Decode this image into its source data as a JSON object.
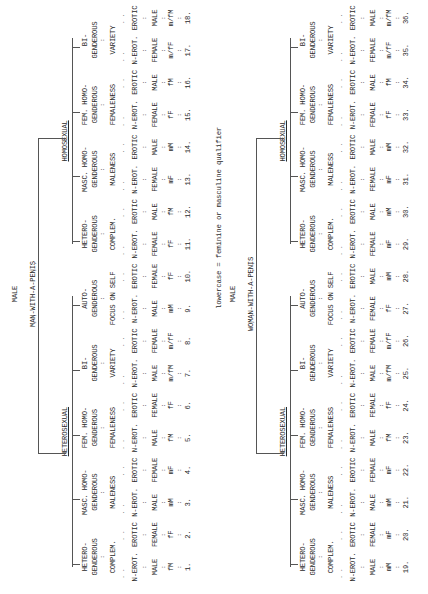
{
  "footnote": "lowercase = feminine or masculine qualifier",
  "trees": [
    {
      "root": "MALE",
      "subject": "MAN-WITH-A-PENIS",
      "branches": [
        {
          "label": "HETEROSEXUAL",
          "groups": [
            {
              "l1": "HETERO-",
              "l2": "GENDEROUS",
              "desc": "COMPLEM.",
              "leaves": [
                {
                  "mode": "N-EROT.",
                  "sex": "MALE",
                  "code": "fM",
                  "n": "1."
                },
                {
                  "mode": "EROTIC",
                  "sex": "FEMALE",
                  "code": "fF",
                  "n": "2."
                }
              ]
            },
            {
              "l1": "MASC. HOMO-",
              "l2": "GENDEROUS",
              "desc": "MALENESS",
              "leaves": [
                {
                  "mode": "N-EROT.",
                  "sex": "MALE",
                  "code": "mM",
                  "n": "3."
                },
                {
                  "mode": "EROTIC",
                  "sex": "FEMALE",
                  "code": "mF",
                  "n": "4."
                }
              ]
            },
            {
              "l1": "FEM. HOMO-",
              "l2": "GENDEROUS",
              "desc": "FEMALENESS",
              "leaves": [
                {
                  "mode": "N-EROT.",
                  "sex": "MALE",
                  "code": "fM",
                  "n": "5."
                },
                {
                  "mode": "EROTIC",
                  "sex": "FEMALE",
                  "code": "fF",
                  "n": "6."
                }
              ]
            },
            {
              "l1": "BI-",
              "l2": "GENDEROUS",
              "desc": "VARIETY",
              "leaves": [
                {
                  "mode": "N-EROT.",
                  "sex": "MALE",
                  "code": "m/fM",
                  "n": "7."
                },
                {
                  "mode": "EROTIC",
                  "sex": "FEMALE",
                  "code": "m/fF",
                  "n": "8."
                }
              ]
            },
            {
              "l1": "AUTO-",
              "l2": "GENDEROUS",
              "desc": "FOCUS ON SELF",
              "leaves": [
                {
                  "mode": "N-EROT.",
                  "sex": "MALE",
                  "code": "mM",
                  "n": "9."
                },
                {
                  "mode": "EROTIC",
                  "sex": "FEMALE",
                  "code": "fF",
                  "n": "10."
                }
              ]
            }
          ]
        },
        {
          "label": "HOMOSEXUAL",
          "groups": [
            {
              "l1": "HETERO-",
              "l2": "GENDEROUS",
              "desc": "COMPLEM.",
              "leaves": [
                {
                  "mode": "N-EROT.",
                  "sex": "FEMALE",
                  "code": "fF",
                  "n": "11."
                },
                {
                  "mode": "EROTIC",
                  "sex": "MALE",
                  "code": "fM",
                  "n": "12."
                }
              ]
            },
            {
              "l1": "MASC. HOMO-",
              "l2": "GENDEROUS",
              "desc": "MALENESS",
              "leaves": [
                {
                  "mode": "N-EROT.",
                  "sex": "FEMALE",
                  "code": "mF",
                  "n": "13."
                },
                {
                  "mode": "EROTIC",
                  "sex": "MALE",
                  "code": "mM",
                  "n": "14."
                }
              ]
            },
            {
              "l1": "FEM. HOMO-",
              "l2": "GENDEROUS",
              "desc": "FEMALENESS",
              "leaves": [
                {
                  "mode": "N-EROT.",
                  "sex": "FEMALE",
                  "code": "fF",
                  "n": "15."
                },
                {
                  "mode": "EROTIC",
                  "sex": "MALE",
                  "code": "fM",
                  "n": "16."
                }
              ]
            },
            {
              "l1": "BI-",
              "l2": "GENDEROUS",
              "desc": "VARIETY",
              "leaves": [
                {
                  "mode": "N-EROT.",
                  "sex": "FEMALE",
                  "code": "m/fF",
                  "n": "17."
                },
                {
                  "mode": "EROTIC",
                  "sex": "MALE",
                  "code": "m/fM",
                  "n": "18."
                }
              ]
            }
          ]
        }
      ]
    },
    {
      "root": "MALE",
      "subject": "WOMAN-WITH-A-PENIS",
      "branches": [
        {
          "label": "HETEROSEXUAL",
          "groups": [
            {
              "l1": "HETERO-",
              "l2": "GENDEROUS",
              "desc": "COMPLEM.",
              "leaves": [
                {
                  "mode": "N-EROT.",
                  "sex": "MALE",
                  "code": "mM",
                  "n": "19."
                },
                {
                  "mode": "EROTIC",
                  "sex": "FEMALE",
                  "code": "mF",
                  "n": "20."
                }
              ]
            },
            {
              "l1": "MASC. HOMO-",
              "l2": "GENDEROUS",
              "desc": "MALENESS",
              "leaves": [
                {
                  "mode": "N-EROT.",
                  "sex": "MALE",
                  "code": "mM",
                  "n": "21."
                },
                {
                  "mode": "EROTIC",
                  "sex": "FEMALE",
                  "code": "mF",
                  "n": "22."
                }
              ]
            },
            {
              "l1": "FEM. HOMO-",
              "l2": "GENDEROUS",
              "desc": "FEMALENESS",
              "leaves": [
                {
                  "mode": "N-EROT.",
                  "sex": "MALE",
                  "code": "fM",
                  "n": "23."
                },
                {
                  "mode": "EROTIC",
                  "sex": "FEMALE",
                  "code": "fF",
                  "n": "24."
                }
              ]
            },
            {
              "l1": "BI-",
              "l2": "GENDEROUS",
              "desc": "VARIETY",
              "leaves": [
                {
                  "mode": "N-EROT.",
                  "sex": "MALE",
                  "code": "m/fM",
                  "n": "25."
                },
                {
                  "mode": "EROTIC",
                  "sex": "FEMALE",
                  "code": "m/fF",
                  "n": "26."
                }
              ]
            },
            {
              "l1": "AUTO-",
              "l2": "GENDEROUS",
              "desc": "FOCUS ON SELF",
              "leaves": [
                {
                  "mode": "N-EROT.",
                  "sex": "FEMALE",
                  "code": "fF",
                  "n": "27."
                },
                {
                  "mode": "EROTIC",
                  "sex": "MALE",
                  "code": "mM",
                  "n": "28."
                }
              ]
            }
          ]
        },
        {
          "label": "HOMOSEXUAL",
          "groups": [
            {
              "l1": "HETERO-",
              "l2": "GENDEROUS",
              "desc": "COMPLEM.",
              "leaves": [
                {
                  "mode": "N-EROT.",
                  "sex": "FEMALE",
                  "code": "mF",
                  "n": "29."
                },
                {
                  "mode": "EROTIC",
                  "sex": "MALE",
                  "code": "mM",
                  "n": "30."
                }
              ]
            },
            {
              "l1": "MASC. HOMO-",
              "l2": "GENDEROUS",
              "desc": "MALENESS",
              "leaves": [
                {
                  "mode": "N-EROT.",
                  "sex": "FEMALE",
                  "code": "mF",
                  "n": "31."
                },
                {
                  "mode": "EROTIC",
                  "sex": "MALE",
                  "code": "mM",
                  "n": "32."
                }
              ]
            },
            {
              "l1": "FEM. HOMO-",
              "l2": "GENDEROUS",
              "desc": "FEMALENESS",
              "leaves": [
                {
                  "mode": "N-EROT.",
                  "sex": "FEMALE",
                  "code": "fF",
                  "n": "33."
                },
                {
                  "mode": "EROTIC",
                  "sex": "MALE",
                  "code": "fM",
                  "n": "34."
                }
              ]
            },
            {
              "l1": "BI-",
              "l2": "GENDEROUS",
              "desc": "VARIETY",
              "leaves": [
                {
                  "mode": "N-EROT.",
                  "sex": "FEMALE",
                  "code": "m/fF",
                  "n": "35."
                },
                {
                  "mode": "EROTIC",
                  "sex": "MALE",
                  "code": "m/fM",
                  "n": "36."
                }
              ]
            }
          ]
        }
      ]
    }
  ]
}
